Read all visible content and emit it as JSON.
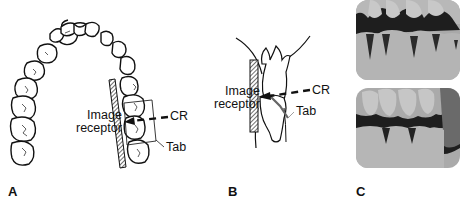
{
  "figure": {
    "panels": [
      {
        "id": "A",
        "label": "A",
        "description": "Occlusal view of dental arch with image receptor placed lingual to posterior teeth, central ray directed through tab",
        "annotations": {
          "image_receptor": [
            "Image",
            "receptor"
          ],
          "cr": "CR",
          "tab": "Tab"
        }
      },
      {
        "id": "B",
        "label": "B",
        "description": "Side view of occluding upper and lower teeth with image receptor and bite tab",
        "annotations": {
          "image_receptor": [
            "Image",
            "receptor"
          ],
          "cr": "CR",
          "tab": "Tab"
        }
      },
      {
        "id": "C",
        "label": "C",
        "description": "Two bitewing radiographs of posterior teeth"
      }
    ],
    "colors": {
      "line": "#111111",
      "receptor_hatch": "#555555",
      "xray_dark": "#1e1e1e",
      "xray_light": "#c8c8c8"
    }
  }
}
